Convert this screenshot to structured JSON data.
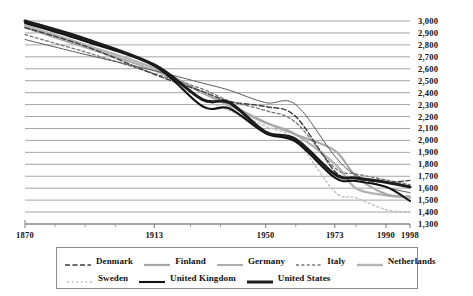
{
  "chart_data": {
    "type": "line",
    "title": "",
    "xlabel": "",
    "ylabel": "",
    "xlim": [
      1870,
      1998
    ],
    "ylim": [
      1300,
      3000
    ],
    "grid": true,
    "legend_position": "bottom",
    "x_tick_labels": [
      "1870",
      "1913",
      "1950",
      "1973",
      "1990",
      "1998"
    ],
    "x_tick_values": [
      1870,
      1913,
      1950,
      1973,
      1990,
      1998
    ],
    "x_minor_ticks": [
      1880,
      1890,
      1900,
      1925,
      1935,
      1960,
      1980
    ],
    "y_tick_labels": [
      "3,000",
      "2,900",
      "2,800",
      "2,700",
      "2,600",
      "2,500",
      "2,400",
      "2,300",
      "2,200",
      "2,100",
      "2,000",
      "1,900",
      "1,800",
      "1,700",
      "1,600",
      "1,500",
      "1,400",
      "1,300"
    ],
    "y_tick_values": [
      3000,
      2900,
      2800,
      2700,
      2600,
      2500,
      2400,
      2300,
      2200,
      2100,
      2000,
      1900,
      1800,
      1700,
      1600,
      1500,
      1400,
      1300
    ],
    "x": [
      1870,
      1890,
      1913,
      1929,
      1938,
      1950,
      1960,
      1973,
      1980,
      1990,
      1998
    ],
    "series": [
      {
        "name": "Denmark",
        "color": "#3f3f3f",
        "width": 1.4,
        "dash": "5,2.5",
        "values": [
          2945,
          2790,
          2553,
          2410,
          2325,
          2283,
          2200,
          1742,
          1680,
          1650,
          1665
        ]
      },
      {
        "name": "Finland",
        "color": "#a8a8a8",
        "width": 2.2,
        "dash": "",
        "values": [
          2945,
          2780,
          2588,
          2400,
          2300,
          2150,
          2050,
          1915,
          1700,
          1550,
          1530
        ]
      },
      {
        "name": "Germany",
        "color": "#5a5a5a",
        "width": 1.0,
        "dash": "",
        "values": [
          2845,
          2720,
          2584,
          2480,
          2420,
          2316,
          2300,
          1868,
          1710,
          1610,
          1562
        ]
      },
      {
        "name": "Italy",
        "color": "#777777",
        "width": 1.3,
        "dash": "3,2.4",
        "values": [
          2886,
          2740,
          2560,
          2430,
          2330,
          2250,
          2150,
          1770,
          1720,
          1670,
          1630
        ]
      },
      {
        "name": "Netherlands",
        "color": "#b4b4b4",
        "width": 2.4,
        "dash": "",
        "values": [
          2964,
          2800,
          2605,
          2400,
          2290,
          2148,
          2050,
          1803,
          1600,
          1540,
          1520
        ]
      },
      {
        "name": "Sweden",
        "color": "#c0c0c0",
        "width": 1.4,
        "dash": "2,2.6",
        "values": [
          2945,
          2790,
          2588,
          2350,
          2250,
          2120,
          2000,
          1571,
          1520,
          1420,
          1402
        ]
      },
      {
        "name": "United Kingdom",
        "color": "#121212",
        "width": 2.1,
        "dash": "",
        "values": [
          2984,
          2830,
          2624,
          2286,
          2267,
          2060,
          1990,
          1688,
          1660,
          1611,
          1493
        ]
      },
      {
        "name": "United States",
        "color": "#1c1c1c",
        "width": 3.0,
        "dash": "",
        "values": [
          3000,
          2850,
          2632,
          2342,
          2316,
          2070,
          2010,
          1717,
          1685,
          1650,
          1610
        ]
      }
    ]
  },
  "legend": {
    "row1": [
      {
        "label": "Denmark"
      },
      {
        "label": "Finland"
      },
      {
        "label": "Germany"
      },
      {
        "label": "Italy"
      },
      {
        "label": "Netherlands"
      }
    ],
    "row2": [
      {
        "label": "Sweden"
      },
      {
        "label": "United Kingdom"
      },
      {
        "label": "United States"
      }
    ]
  }
}
